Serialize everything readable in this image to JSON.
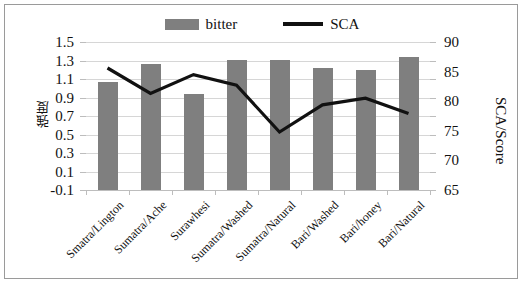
{
  "legend": {
    "items": [
      {
        "label": "bitter",
        "type": "bar",
        "color": "#7f7f7f"
      },
      {
        "label": "SCA",
        "type": "line",
        "color": "#111111"
      }
    ]
  },
  "axes": {
    "left_title": "強度",
    "right_title": "SCA/Score",
    "left_ticks": [
      "1.5",
      "1.3",
      "1.1",
      "0.9",
      "0.7",
      "0.5",
      "0.3",
      "0.1",
      "-0.1"
    ],
    "right_ticks": [
      "90",
      "85",
      "80",
      "75",
      "70",
      "65"
    ]
  },
  "chart_data": {
    "type": "bar",
    "title": "",
    "xlabel": "",
    "ylabel": "強度",
    "y2label": "SCA/Score",
    "ylim": [
      -0.1,
      1.5
    ],
    "y2lim": [
      65,
      90
    ],
    "grid": true,
    "legend_position": "top-center",
    "categories": [
      "Smatra/Lington",
      "Sumatra/Ache",
      "Surawhesi",
      "Sumatra/Washed",
      "Sumatra/Natural",
      "Bari/Washed",
      "Bari/honey",
      "Bari/Natural"
    ],
    "series": [
      {
        "name": "bitter",
        "type": "bar",
        "axis": "left",
        "color": "#7f7f7f",
        "values": [
          1.07,
          1.26,
          0.94,
          1.31,
          1.31,
          1.22,
          1.2,
          1.34
        ]
      },
      {
        "name": "SCA",
        "type": "line",
        "axis": "right",
        "color": "#111111",
        "values": [
          85.6,
          81.3,
          84.5,
          82.7,
          74.8,
          79.4,
          80.5,
          77.9
        ]
      }
    ]
  }
}
